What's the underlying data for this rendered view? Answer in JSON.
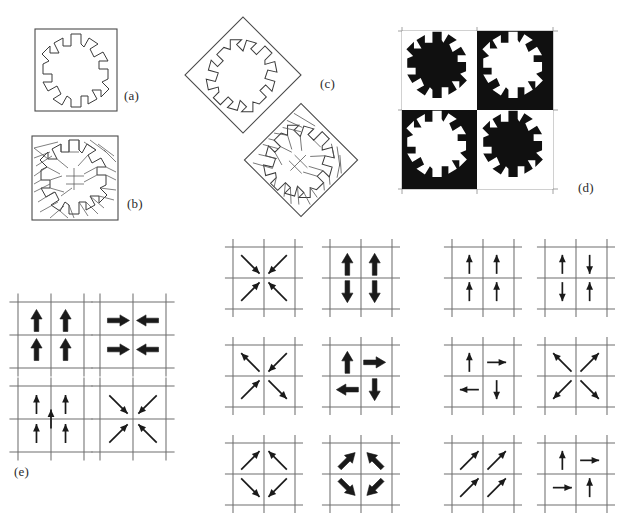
{
  "figure": {
    "background_color": "#ffffff",
    "ink_color": "#1a1a1a",
    "grid_color": "#6f6f6f",
    "fill_black": "#101010",
    "fill_white": "#ffffff",
    "width": 637,
    "height": 530
  },
  "panels": [
    {
      "id": "a",
      "label": "(a)",
      "label_x": 124,
      "label_y": 88,
      "caption_text": "(a)",
      "kind": "outline-snowflake-in-square",
      "x": 35,
      "y": 28,
      "w": 82,
      "h": 82,
      "rotation": 0,
      "dissected": false,
      "description": "Snowflake (six-armed asterisk) outline inscribed in a square frame"
    },
    {
      "id": "b",
      "label": "(b)",
      "label_x": 127,
      "label_y": 196,
      "caption_text": "(b)",
      "kind": "dissected-snowflake-in-square",
      "x": 30,
      "y": 135,
      "w": 90,
      "h": 85,
      "rotation": 0,
      "dissected": true,
      "piece_count": 28,
      "description": "Same snowflake dissected into many small polygonal pieces"
    },
    {
      "id": "c",
      "label": "(c)",
      "label_x": 320,
      "label_y": 84,
      "caption_text": "(c)",
      "kind": "rotated-diamond-pair",
      "description": "Two diamond (45-degree rotated square) copies: upper outline only, lower dissected",
      "items": [
        {
          "cx": 243,
          "cy": 75,
          "half": 58,
          "rotation": 45,
          "dissected": false
        },
        {
          "cx": 300,
          "cy": 160,
          "half": 56,
          "rotation": 45,
          "dissected": true
        }
      ]
    },
    {
      "id": "d",
      "label": "(d)",
      "label_x": 578,
      "label_y": 188,
      "caption_text": "(d)",
      "kind": "checkerboard-tiling",
      "x": 400,
      "y": 30,
      "w": 150,
      "h": 155,
      "rows": 2,
      "cols": 2,
      "cells": [
        {
          "row": 0,
          "col": 0,
          "background": "white",
          "motif": "black"
        },
        {
          "row": 0,
          "col": 1,
          "background": "black",
          "motif": "white"
        },
        {
          "row": 1,
          "col": 0,
          "background": "black",
          "motif": "white"
        },
        {
          "row": 1,
          "col": 1,
          "background": "white",
          "motif": "black"
        }
      ],
      "description": "Two-by-two checkerboard of snowflake motifs in reversed contrast"
    },
    {
      "id": "e",
      "label": "(e)",
      "label_x": 14,
      "label_y": 472,
      "caption_text": "(e)",
      "kind": "arrow-grid-set",
      "description": "Twelve small arrow diagrams indicating symmetry operations"
    }
  ],
  "arrow_grids": [
    {
      "name": "grid-e-1",
      "group": "e",
      "x": 18,
      "y": 302,
      "size": 66,
      "cells": 2,
      "grid_type": "2x2",
      "arrow_style": "thick",
      "arrows": [
        {
          "cell": "top-left",
          "direction": "up",
          "angle": 0
        },
        {
          "cell": "top-right",
          "direction": "up",
          "angle": 0
        },
        {
          "cell": "bottom-left",
          "direction": "up",
          "angle": 0
        },
        {
          "cell": "bottom-right",
          "direction": "up",
          "angle": 0
        }
      ]
    },
    {
      "name": "grid-e-2",
      "group": "e",
      "x": 100,
      "y": 302,
      "size": 66,
      "cells": 2,
      "grid_type": "2x2",
      "arrow_style": "thick",
      "arrows": [
        {
          "cell": "top-left",
          "direction": "right",
          "angle": 90
        },
        {
          "cell": "top-right",
          "direction": "left",
          "angle": 270
        },
        {
          "cell": "bottom-left",
          "direction": "right",
          "angle": 90
        },
        {
          "cell": "bottom-right",
          "direction": "left",
          "angle": 270
        }
      ]
    },
    {
      "name": "grid-e-3",
      "group": "e",
      "x": 18,
      "y": 386,
      "size": 66,
      "cells": 2,
      "grid_type": "2x2-with-center",
      "arrow_style": "thin",
      "arrows": [
        {
          "cell": "top-left",
          "direction": "up",
          "angle": 0
        },
        {
          "cell": "top-right",
          "direction": "up",
          "angle": 0
        },
        {
          "cell": "center",
          "direction": "up",
          "angle": 0
        },
        {
          "cell": "bottom-left",
          "direction": "up",
          "angle": 0
        },
        {
          "cell": "bottom-right",
          "direction": "up",
          "angle": 0
        }
      ]
    },
    {
      "name": "grid-e-4",
      "group": "e",
      "x": 100,
      "y": 386,
      "size": 66,
      "cells": 2,
      "grid_type": "2x2",
      "arrow_style": "thin-long",
      "arrows": [
        {
          "cell": "top-left",
          "direction": "down-right",
          "angle": 135
        },
        {
          "cell": "top-right",
          "direction": "down-left",
          "angle": 225
        },
        {
          "cell": "bottom-left",
          "direction": "up-right",
          "angle": 45
        },
        {
          "cell": "bottom-right",
          "direction": "up-left",
          "angle": 315
        }
      ]
    },
    {
      "name": "grid-m-1",
      "group": "middle",
      "x": 233,
      "y": 247,
      "size": 62,
      "cells": 2,
      "grid_type": "2x2",
      "arrow_style": "thin-long",
      "arrows": [
        {
          "cell": "top-left",
          "direction": "down-right",
          "angle": 135
        },
        {
          "cell": "top-right",
          "direction": "down-left",
          "angle": 225
        },
        {
          "cell": "bottom-left",
          "direction": "up-right",
          "angle": 45
        },
        {
          "cell": "bottom-right",
          "direction": "up-left",
          "angle": 315
        }
      ]
    },
    {
      "name": "grid-m-2",
      "group": "middle",
      "x": 330,
      "y": 247,
      "size": 62,
      "cells": 2,
      "grid_type": "2x2",
      "arrow_style": "thick",
      "arrows": [
        {
          "cell": "top-left",
          "direction": "up",
          "angle": 0
        },
        {
          "cell": "top-right",
          "direction": "up",
          "angle": 0
        },
        {
          "cell": "bottom-left",
          "direction": "down",
          "angle": 180
        },
        {
          "cell": "bottom-right",
          "direction": "down",
          "angle": 180
        }
      ]
    },
    {
      "name": "grid-m-3",
      "group": "middle",
      "x": 233,
      "y": 345,
      "size": 62,
      "cells": 2,
      "grid_type": "2x2",
      "arrow_style": "thin-long",
      "arrows": [
        {
          "cell": "top-left",
          "direction": "up-left",
          "angle": 315
        },
        {
          "cell": "top-right",
          "direction": "down-left",
          "angle": 225
        },
        {
          "cell": "bottom-left",
          "direction": "up-right",
          "angle": 45
        },
        {
          "cell": "bottom-right",
          "direction": "down-right",
          "angle": 135
        }
      ]
    },
    {
      "name": "grid-m-4",
      "group": "middle",
      "x": 330,
      "y": 345,
      "size": 62,
      "cells": 2,
      "grid_type": "2x2",
      "arrow_style": "thick",
      "arrows": [
        {
          "cell": "top-left",
          "direction": "up",
          "angle": 0
        },
        {
          "cell": "top-right",
          "direction": "right",
          "angle": 90
        },
        {
          "cell": "bottom-left",
          "direction": "left",
          "angle": 270
        },
        {
          "cell": "bottom-right",
          "direction": "down",
          "angle": 180
        }
      ]
    },
    {
      "name": "grid-m-5",
      "group": "middle",
      "x": 233,
      "y": 443,
      "size": 62,
      "cells": 2,
      "grid_type": "2x2",
      "arrow_style": "thin-long",
      "arrows": [
        {
          "cell": "top-left",
          "direction": "up-right",
          "angle": 45
        },
        {
          "cell": "top-right",
          "direction": "up-left",
          "angle": 315
        },
        {
          "cell": "bottom-left",
          "direction": "down-right",
          "angle": 135
        },
        {
          "cell": "bottom-right",
          "direction": "down-left",
          "angle": 225
        }
      ]
    },
    {
      "name": "grid-m-6",
      "group": "middle",
      "x": 330,
      "y": 443,
      "size": 62,
      "cells": 2,
      "grid_type": "2x2",
      "arrow_style": "thick",
      "arrows": [
        {
          "cell": "top-left",
          "direction": "up-right",
          "angle": 45
        },
        {
          "cell": "top-right",
          "direction": "up-left",
          "angle": 315
        },
        {
          "cell": "bottom-left",
          "direction": "down-right",
          "angle": 135
        },
        {
          "cell": "bottom-right",
          "direction": "down-left",
          "angle": 225
        }
      ]
    },
    {
      "name": "grid-r-1",
      "group": "right",
      "x": 452,
      "y": 247,
      "size": 62,
      "cells": 2,
      "grid_type": "2x2",
      "arrow_style": "thin",
      "arrows": [
        {
          "cell": "top-left",
          "direction": "up",
          "angle": 0
        },
        {
          "cell": "top-right",
          "direction": "up",
          "angle": 0
        },
        {
          "cell": "bottom-left",
          "direction": "up",
          "angle": 0
        },
        {
          "cell": "bottom-right",
          "direction": "up",
          "angle": 0
        }
      ]
    },
    {
      "name": "grid-r-2",
      "group": "right",
      "x": 545,
      "y": 247,
      "size": 62,
      "cells": 2,
      "grid_type": "2x2",
      "arrow_style": "thin",
      "arrows": [
        {
          "cell": "top-left",
          "direction": "up",
          "angle": 0
        },
        {
          "cell": "top-right",
          "direction": "down",
          "angle": 180
        },
        {
          "cell": "bottom-left",
          "direction": "down",
          "angle": 180
        },
        {
          "cell": "bottom-right",
          "direction": "up",
          "angle": 0
        }
      ]
    },
    {
      "name": "grid-r-3",
      "group": "right",
      "x": 452,
      "y": 345,
      "size": 62,
      "cells": 2,
      "grid_type": "2x2",
      "arrow_style": "thin",
      "arrows": [
        {
          "cell": "top-left",
          "direction": "up",
          "angle": 0
        },
        {
          "cell": "top-right",
          "direction": "right",
          "angle": 90
        },
        {
          "cell": "bottom-left",
          "direction": "left",
          "angle": 270
        },
        {
          "cell": "bottom-right",
          "direction": "down",
          "angle": 180
        }
      ]
    },
    {
      "name": "grid-r-4",
      "group": "right",
      "x": 545,
      "y": 345,
      "size": 62,
      "cells": 2,
      "grid_type": "2x2",
      "arrow_style": "thin-long",
      "arrows": [
        {
          "cell": "top-left",
          "direction": "up-left",
          "angle": 315
        },
        {
          "cell": "top-right",
          "direction": "up-right",
          "angle": 45
        },
        {
          "cell": "bottom-left",
          "direction": "down-left",
          "angle": 225
        },
        {
          "cell": "bottom-right",
          "direction": "down-right",
          "angle": 135
        }
      ]
    },
    {
      "name": "grid-r-5",
      "group": "right",
      "x": 452,
      "y": 443,
      "size": 62,
      "cells": 2,
      "grid_type": "2x2",
      "arrow_style": "thin-long",
      "arrows": [
        {
          "cell": "top-left",
          "direction": "up-right",
          "angle": 45
        },
        {
          "cell": "top-right",
          "direction": "up-right",
          "angle": 45
        },
        {
          "cell": "bottom-left",
          "direction": "up-right",
          "angle": 45
        },
        {
          "cell": "bottom-right",
          "direction": "up-right",
          "angle": 45
        }
      ]
    },
    {
      "name": "grid-r-6",
      "group": "right",
      "x": 545,
      "y": 443,
      "size": 62,
      "cells": 2,
      "grid_type": "2x2",
      "arrow_style": "thin",
      "arrows": [
        {
          "cell": "top-left",
          "direction": "up",
          "angle": 0
        },
        {
          "cell": "top-right",
          "direction": "right",
          "angle": 90
        },
        {
          "cell": "bottom-left",
          "direction": "right",
          "angle": 90
        },
        {
          "cell": "bottom-right",
          "direction": "up",
          "angle": 0
        }
      ]
    }
  ]
}
